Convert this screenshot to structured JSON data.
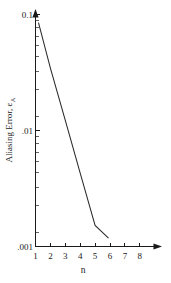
{
  "chart_data": {
    "type": "line",
    "title": "",
    "xlabel": "n",
    "ylabel": "Aliasing Error, ε",
    "ylabel_subscript": "A",
    "yscale": "log",
    "xscale": "linear",
    "xlim": [
      1,
      8.6
    ],
    "ylim": [
      0.001,
      0.1
    ],
    "grid": false,
    "legend": false,
    "x_ticks": [
      1,
      2,
      3,
      4,
      5,
      6,
      7,
      8
    ],
    "x_tick_labels": [
      "1",
      "2",
      "3",
      "4",
      "5",
      "6",
      "7",
      "8"
    ],
    "y_ticks": [
      0.1,
      0.01,
      0.001
    ],
    "y_tick_labels": [
      "0.1",
      ".01",
      ".001"
    ],
    "y_minor_ticks": [
      0.09,
      0.08,
      0.07,
      0.06,
      0.05,
      0.04,
      0.03,
      0.02,
      0.009,
      0.008,
      0.007,
      0.006,
      0.005,
      0.004,
      0.003,
      0.002
    ],
    "series": [
      {
        "name": "Aliasing Error",
        "x": [
          1.2,
          2.0,
          3.0,
          4.0,
          5.0,
          5.9
        ],
        "values": [
          0.085,
          0.0345,
          0.0122,
          0.0043,
          0.00152,
          0.00118
        ]
      }
    ],
    "line_color": "#2b2b2b",
    "axis_color": "#1a1a1a",
    "background_color": "#ffffff",
    "x_axis_arrow": true,
    "y_axis_arrow": true
  },
  "axes": {
    "x_title": "n",
    "y_title_main": "Aliasing Error, ε",
    "y_title_sub": "A"
  },
  "ticks": {
    "x": [
      {
        "label": "1"
      },
      {
        "label": "2"
      },
      {
        "label": "3"
      },
      {
        "label": "4"
      },
      {
        "label": "5"
      },
      {
        "label": "6"
      },
      {
        "label": "7"
      },
      {
        "label": "8"
      }
    ],
    "y": [
      {
        "label": "0.1"
      },
      {
        "label": ".01"
      },
      {
        "label": ".001"
      }
    ]
  }
}
